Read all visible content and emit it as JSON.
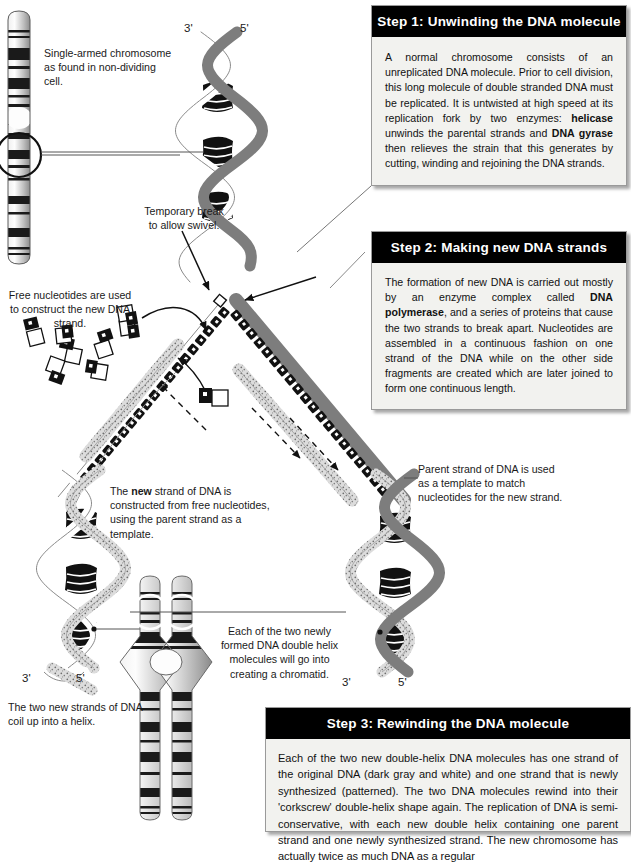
{
  "figure": {
    "domain": "biology-diagram"
  },
  "steps": [
    {
      "id": "step1",
      "header": "Step 1:  Unwinding the DNA molecule",
      "body_html": "A normal chromosome consists of an unreplicated DNA molecule. Prior to cell division, this long molecule of double stranded DNA must be replicated. It is untwisted at high speed at its replication fork by two enzymes: <b>helicase</b> unwinds the parental strands and <b>DNA gyrase</b> then relieves the strain that this generates by cutting, winding and rejoining the DNA strands."
    },
    {
      "id": "step2",
      "header": "Step 2:  Making new DNA strands",
      "body_html": "The formation of new DNA is carried out mostly by an enzyme complex called <b>DNA polymerase</b>, and a series of proteins that cause the two strands to break apart. Nucleotides are assembled in a continuous fashion on one strand of the DNA while on the other side fragments are created which are later joined to form one continuous length."
    },
    {
      "id": "step3",
      "header": "Step 3:  Rewinding the DNA molecule",
      "body_html": "Each of the two new double-helix DNA molecules has one strand of the original DNA (dark gray and white) and one strand that is newly synthesized (patterned). The two DNA molecules rewind into their 'corkscrew' double-helix shape again. The replication of DNA is semi-conservative, with each new double helix containing one parent strand and one newly synthesized strand. The new chromosome has actually twice as much DNA as a regular"
    }
  ],
  "annotations": {
    "single_chromosome": "Single-armed chromosome as found in non-dividing cell.",
    "temporary_break": "Temporary break to allow swivel.",
    "free_nucleotides": "Free nucleotides are used to construct the new DNA strand.",
    "new_strand_html": "The <b>new</b> strand of DNA is constructed from free nucleotides, using the parent strand as a template.",
    "parent_strand": "Parent strand of DNA is used as a template to match nucleotides for the new strand.",
    "chromatid": "Each of the two newly formed DNA double helix molecules will go into creating a chromatid.",
    "coil_helix": "The two new strands of DNA coil up into a helix."
  },
  "prime_labels": {
    "top_left": "3'",
    "top_right": "5'",
    "bottom_left_left": "3'",
    "bottom_left_right": "5'",
    "bottom_right_left": "3'",
    "bottom_right_right": "5'"
  },
  "colors": {
    "header_bg": "#000000",
    "header_text": "#ffffff",
    "box_bg": "#f2f2ef",
    "box_border": "#9a9a9a",
    "parent_strand": "#7d7d7d",
    "new_strand": "#d8d8d8",
    "white_strand": "#ffffff",
    "chromosome_band_dark": "#1a1a1a",
    "chromosome_band_mid": "#8c8c8c",
    "chromosome_band_light": "#e8e8e8",
    "text": "#1a1a1a"
  }
}
